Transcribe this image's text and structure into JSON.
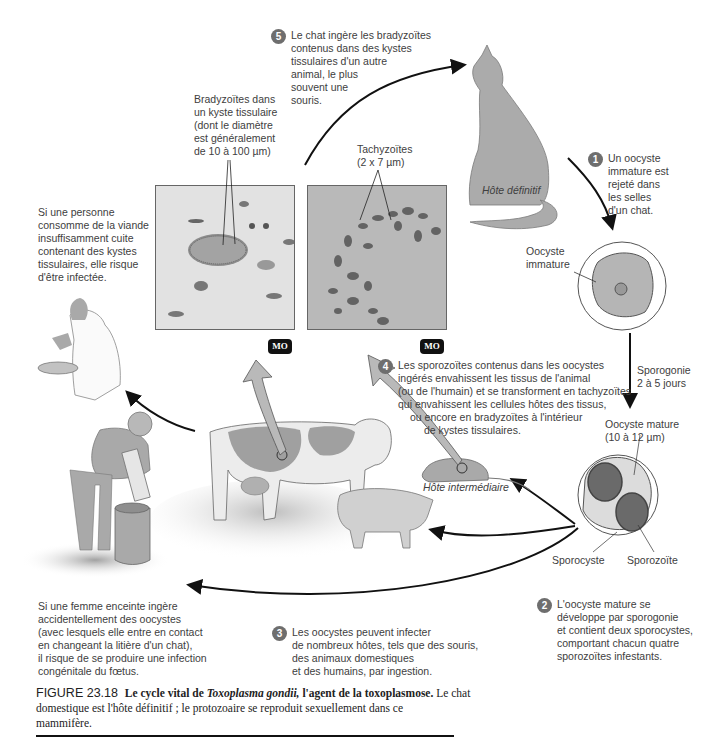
{
  "figure": {
    "number": "FIGURE 23.18",
    "title_bold_prefix": "Le cycle vital de ",
    "title_italic": "Toxoplasma gondii,",
    "title_bold_suffix": " l'agent de la toxoplasmose.",
    "caption_line1_rest": " Le chat",
    "caption_line2": "domestique est l'hôte définitif ; le protozoaire se reproduit sexuellement dans ce",
    "caption_line3": "mammifère."
  },
  "steps": [
    {
      "number": "1",
      "lines": [
        "Un oocyste",
        "immature est",
        "rejeté dans",
        "les selles",
        "d'un chat."
      ]
    },
    {
      "number": "2",
      "lines": [
        "L'oocyste mature se",
        "développe par sporogonie",
        "et contient deux sporocystes,",
        "comportant chacun quatre",
        "sporozoïtes infestants."
      ]
    },
    {
      "number": "3",
      "lines": [
        "Les oocystes peuvent infecter",
        "de nombreux hôtes, tels que des souris,",
        "des animaux domestiques",
        "et des humains, par ingestion."
      ]
    },
    {
      "number": "4",
      "lines": [
        "Les sporozoïtes contenus dans les oocystes",
        "ingérés envahissent les tissus de l'animal",
        "(ou de l'humain) et se transforment en tachyzoïtes",
        "qui envahissent les cellules hôtes des tissus,",
        "ou encore en bradyzoïtes à l'intérieur",
        "de kystes tissulaires."
      ]
    },
    {
      "number": "5",
      "lines": [
        "Le chat ingère les bradyzoïtes",
        "contenus dans des kystes",
        "tissulaires d'un autre",
        "animal, le plus",
        "souvent une",
        "souris."
      ]
    }
  ],
  "labels": {
    "bradyzoites": [
      "Bradyzoïtes dans",
      "un kyste tissulaire",
      "(dont le diamètre",
      "est généralement",
      "de 10 à 100 µm)"
    ],
    "tachyzoites": [
      "Tachyzoïtes",
      "(2 x 7 µm)"
    ],
    "definitive_host": "Hôte définitif",
    "intermediate_host": "Hôte intermédiaire",
    "immature_oocyst": [
      "Oocyste",
      "immature"
    ],
    "sporogony": [
      "Sporogonie",
      "2 à 5 jours"
    ],
    "mature_oocyst": [
      "Oocyste mature",
      "(10 à 12 µm)"
    ],
    "sporocyst": "Sporocyste",
    "sporozoite": "Sporozoïte",
    "meat_note": [
      "Si une personne",
      "consomme de la viande",
      "insuffisamment cuite",
      "contenant des kystes",
      "tissulaires, elle risque",
      "d'être infectée."
    ],
    "pregnant_note": [
      "Si une femme enceinte ingère",
      "accidentellement des oocystes",
      "(avec lesquels elle entre en contact",
      "en changeant la litière d'un chat),",
      "il risque de se produire une infection",
      "congénitale du fœtus."
    ],
    "micrograph_badge_left": "MO",
    "micrograph_badge_right": "MO"
  },
  "colors": {
    "illustration_gray": "#a9a9a9",
    "step_badge": "#6e6e6e",
    "arrow": "#111111",
    "micrograph_left_bg": "#e4e4e4",
    "micrograph_right_bg": "#b9b9b9"
  }
}
